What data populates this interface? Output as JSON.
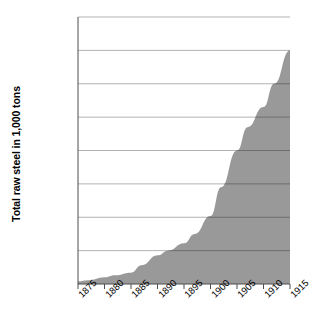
{
  "chart_data": {
    "type": "area",
    "title": "",
    "xlabel": "",
    "ylabel": "Total raw steel in 1,000 tons",
    "xlim": [
      1875,
      1915
    ],
    "ylim": [
      0,
      40000
    ],
    "grid": true,
    "legend": "none",
    "series_color": "#999999",
    "gridline_color": "#b3b3b3",
    "axis_color": "#4d4d4d",
    "x": [
      1875,
      1880,
      1885,
      1890,
      1895,
      1900,
      1905,
      1910,
      1915
    ],
    "xtick_labels": [
      "1875",
      "1880",
      "1885",
      "1890",
      "1895",
      "1900",
      "1905",
      "1910",
      "1915"
    ],
    "ytick_values": [
      0,
      5000,
      10000,
      15000,
      20000,
      25000,
      30000,
      35000,
      40000
    ],
    "ytick_labels": [
      "0",
      "5,000",
      "10,000",
      "15,000",
      "20,000",
      "25,000",
      "30,000",
      "35,000",
      "40,000"
    ],
    "values": [
      380,
      1000,
      1700,
      4300,
      6100,
      10200,
      20000,
      26500,
      35000
    ],
    "points": [
      {
        "year": 1875,
        "value": 380
      },
      {
        "year": 1877,
        "value": 550
      },
      {
        "year": 1880,
        "value": 1000
      },
      {
        "year": 1882,
        "value": 1300
      },
      {
        "year": 1885,
        "value": 1700
      },
      {
        "year": 1887,
        "value": 2800
      },
      {
        "year": 1890,
        "value": 4300
      },
      {
        "year": 1892,
        "value": 5000
      },
      {
        "year": 1895,
        "value": 6100
      },
      {
        "year": 1897,
        "value": 7500
      },
      {
        "year": 1900,
        "value": 10200
      },
      {
        "year": 1902,
        "value": 14500
      },
      {
        "year": 1905,
        "value": 20000
      },
      {
        "year": 1907,
        "value": 23500
      },
      {
        "year": 1910,
        "value": 26500
      },
      {
        "year": 1912,
        "value": 30000
      },
      {
        "year": 1915,
        "value": 35000
      }
    ]
  }
}
